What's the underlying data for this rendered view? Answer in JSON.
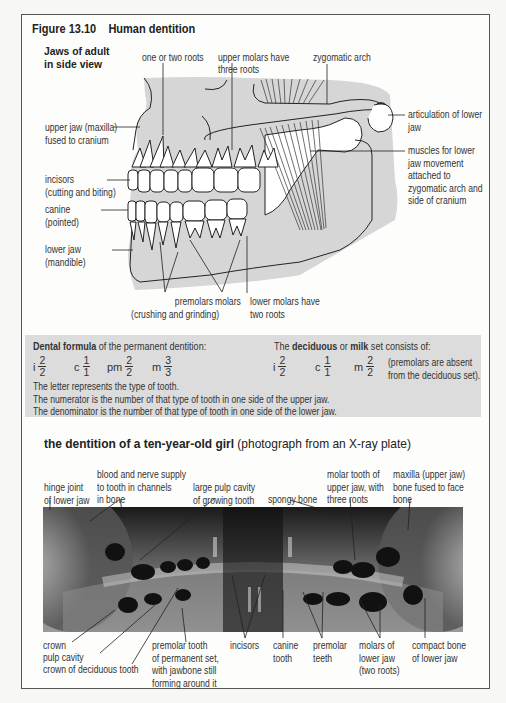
{
  "figure": {
    "title": "Figure 13.10    Human dentition",
    "jaw_diagram": {
      "subtitle_line1": "Jaws of adult",
      "subtitle_line2": "in side view",
      "labels_top": {
        "one_or_two_roots": "one or two roots",
        "upper_molars_1": "upper molars have",
        "upper_molars_2": "three roots",
        "zygomatic_arch": "zygomatic arch"
      },
      "labels_left": {
        "upper_jaw_1": "upper jaw (maxilla)",
        "upper_jaw_2": "fused to cranium",
        "incisors_1": "incisors",
        "incisors_2": "(cutting and biting)",
        "canine_1": "canine",
        "canine_2": "(pointed)",
        "lower_jaw_1": "lower jaw",
        "lower_jaw_2": "(mandible)"
      },
      "labels_right": {
        "articulation_1": "articulation of lower",
        "articulation_2": "jaw",
        "muscles_1": "muscles for lower",
        "muscles_2": "jaw movement",
        "muscles_3": "attached to",
        "muscles_4": "zygomatic arch and",
        "muscles_5": "side of cranium"
      },
      "labels_bottom": {
        "premolars_1": "premolars",
        "premolars_2": "(crushing and grinding)",
        "molars": "molars",
        "lower_molars_1": "lower molars have",
        "lower_molars_2": "two roots"
      }
    },
    "dental_formula": {
      "permanent_heading_bold": "Dental formula",
      "permanent_heading_rest": " of the permanent dentition:",
      "permanent": [
        {
          "letter": "i",
          "num": "2",
          "den": "2"
        },
        {
          "letter": "c",
          "num": "1",
          "den": "1"
        },
        {
          "letter": "pm",
          "num": "2",
          "den": "2"
        },
        {
          "letter": "m",
          "num": "3",
          "den": "3"
        }
      ],
      "deciduous_heading_pre": "The ",
      "deciduous_heading_bold1": "deciduous",
      "deciduous_heading_mid": " or ",
      "deciduous_heading_bold2": "milk",
      "deciduous_heading_rest": " set consists of:",
      "deciduous": [
        {
          "letter": "i",
          "num": "2",
          "den": "2"
        },
        {
          "letter": "c",
          "num": "1",
          "den": "1"
        },
        {
          "letter": "m",
          "num": "2",
          "den": "2"
        }
      ],
      "deciduous_note_1": "(premolars are absent",
      "deciduous_note_2": "from the deciduous set).",
      "notes": [
        "The letter represents the type of tooth.",
        "The numerator is the number of that type of tooth in one side of the upper jaw.",
        "The denominator is the number of that type of tooth in one side of the lower jaw."
      ]
    },
    "xray": {
      "title_bold": "the dentition of a ten-year-old girl",
      "title_rest": " (photograph from an X-ray plate)",
      "labels_top": {
        "hinge_1": "hinge joint",
        "hinge_2": "of lower jaw",
        "blood_1": "blood and nerve supply",
        "blood_2": "to tooth in channels",
        "blood_3": "in bone",
        "pulp_1": "large pulp cavity",
        "pulp_2": "of growing tooth",
        "spongy": "spongy bone",
        "molar_upper_1": "molar tooth of",
        "molar_upper_2": "upper jaw, with",
        "molar_upper_3": "three roots",
        "maxilla_1": "maxilla (upper jaw)",
        "maxilla_2": "bone fused to face",
        "maxilla_3": "bone"
      },
      "labels_bottom": {
        "crown": "crown",
        "pulp_cavity": "pulp cavity",
        "crown_deciduous": "crown of deciduous tooth",
        "premolar_perm_1": "premolar tooth",
        "premolar_perm_2": "of permanent set,",
        "premolar_perm_3": "with jawbone still",
        "premolar_perm_4": "forming around it",
        "incisors": "incisors",
        "canine_1": "canine",
        "canine_2": "tooth",
        "premolar_teeth_1": "premolar",
        "premolar_teeth_2": "teeth",
        "molars_lower_1": "molars of",
        "molars_lower_2": "lower jaw",
        "molars_lower_3": "(two roots)",
        "compact_1": "compact bone",
        "compact_2": "of lower jaw"
      }
    }
  }
}
